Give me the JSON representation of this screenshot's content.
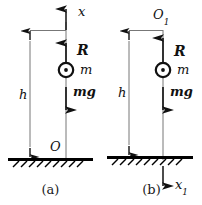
{
  "figure": {
    "type": "physics-free-body-diagram",
    "panels": [
      {
        "id": "a",
        "caption": "(a)",
        "axis_label": "x",
        "axis_direction": "up",
        "origin_label": "O",
        "origin_position": "ground",
        "height_label": "h",
        "mass_label": "m",
        "force_up_label": "R",
        "force_down_label": "mg",
        "mass_symbol": "circle-with-center-dot",
        "ground": "hatched"
      },
      {
        "id": "b",
        "caption": "(b)",
        "axis_label": "x",
        "axis_label_subscript": "1",
        "axis_direction": "down",
        "origin_label": "O",
        "origin_label_subscript": "1",
        "origin_position": "top",
        "height_label": "h",
        "mass_label": "m",
        "force_up_label": "R",
        "force_down_label": "mg",
        "mass_symbol": "circle-with-center-dot",
        "ground": "hatched"
      }
    ]
  },
  "colors": {
    "ink": "#111111",
    "line": "#555555",
    "ground": "#000000",
    "background": "#ffffff"
  }
}
